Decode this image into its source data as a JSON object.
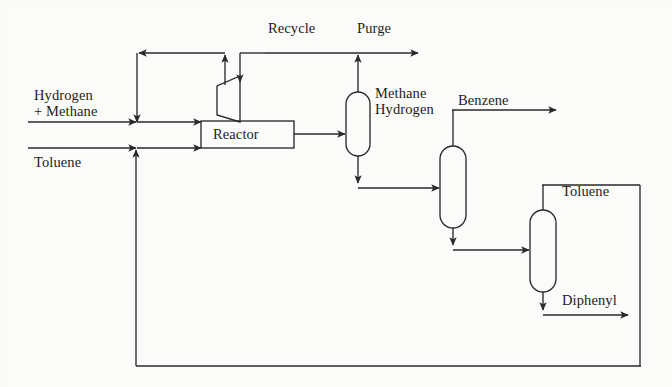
{
  "diagram": {
    "type": "process-flow-diagram",
    "stroke_color": "#2a2a2a",
    "background_color": "#fbfbfa",
    "text_color": "#1d1d1d"
  },
  "units": [
    {
      "id": "reactor",
      "label": "Reactor",
      "shape": "rectangle"
    },
    {
      "id": "compressor",
      "label": "",
      "shape": "trapezoid"
    },
    {
      "id": "flash",
      "label": "",
      "shape": "capsule"
    },
    {
      "id": "column-1",
      "label": "",
      "shape": "capsule"
    },
    {
      "id": "column-2",
      "label": "",
      "shape": "capsule"
    }
  ],
  "streams": {
    "feed_gas_line1": "Hydrogen",
    "feed_gas_line2": "+ Methane",
    "feed_liquid": "Toluene",
    "recycle": "Recycle",
    "purge": "Purge",
    "overhead_line1": "Methane",
    "overhead_line2": "Hydrogen",
    "product_benzene": "Benzene",
    "recycle_toluene": "Toluene",
    "byproduct_diphenyl": "Diphenyl"
  },
  "background_text": {
    "row_1": "",
    "row_2": "",
    "row_3": "",
    "row_4": ""
  }
}
